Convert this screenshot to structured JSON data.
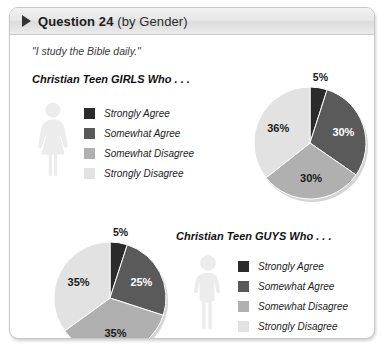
{
  "header": {
    "marker_icon": "triangle-right-icon",
    "title": "Question 24",
    "subtitle": "(by Gender)"
  },
  "quote": "\"I study the Bible daily.\"",
  "palette": {
    "strongly_agree": "#2b2b2b",
    "somewhat_agree": "#5a5a5a",
    "somewhat_disagree": "#b0b0b0",
    "strongly_disagree": "#e2e2e2",
    "figure_fill": "#ececec",
    "header_text": "#1b1b1b"
  },
  "girls": {
    "title": "Christian Teen GIRLS Who . . .",
    "figure_icon": "female-figure-icon",
    "legend": [
      {
        "label": "Strongly Agree",
        "color": "#2b2b2b"
      },
      {
        "label": "Somewhat Agree",
        "color": "#5a5a5a"
      },
      {
        "label": "Somewhat Disagree",
        "color": "#b0b0b0"
      },
      {
        "label": "Strongly Disagree",
        "color": "#e2e2e2"
      }
    ]
  },
  "guys": {
    "title": "Christian Teen GUYS Who . . .",
    "figure_icon": "male-figure-icon",
    "legend": [
      {
        "label": "Strongly Agree",
        "color": "#2b2b2b"
      },
      {
        "label": "Somewhat Agree",
        "color": "#5a5a5a"
      },
      {
        "label": "Somewhat Disagree",
        "color": "#b0b0b0"
      },
      {
        "label": "Strongly Disagree",
        "color": "#e2e2e2"
      }
    ]
  },
  "chart_data": [
    {
      "type": "pie",
      "title": "Christian Teen GIRLS Who . . .",
      "categories": [
        "Strongly Agree",
        "Somewhat Agree",
        "Somewhat Disagree",
        "Strongly Disagree"
      ],
      "values": [
        5,
        30,
        30,
        36
      ],
      "labels": [
        "5%",
        "30%",
        "30%",
        "36%"
      ],
      "colors": [
        "#2b2b2b",
        "#5a5a5a",
        "#b0b0b0",
        "#e2e2e2"
      ],
      "label_colors": [
        "#1a1a1a",
        "#ffffff",
        "#1a1a1a",
        "#1a1a1a"
      ],
      "label_outside": [
        true,
        false,
        false,
        false
      ],
      "start_angle": 0,
      "direction": "clockwise",
      "legend_position": "left"
    },
    {
      "type": "pie",
      "title": "Christian Teen GUYS Who . . .",
      "categories": [
        "Strongly Agree",
        "Somewhat Agree",
        "Somewhat Disagree",
        "Strongly Disagree"
      ],
      "values": [
        5,
        25,
        35,
        35
      ],
      "labels": [
        "5%",
        "25%",
        "35%",
        "35%"
      ],
      "colors": [
        "#2b2b2b",
        "#5a5a5a",
        "#b0b0b0",
        "#e2e2e2"
      ],
      "label_colors": [
        "#1a1a1a",
        "#ffffff",
        "#1a1a1a",
        "#1a1a1a"
      ],
      "label_outside": [
        true,
        false,
        false,
        false
      ],
      "start_angle": 0,
      "direction": "clockwise",
      "legend_position": "right"
    }
  ]
}
